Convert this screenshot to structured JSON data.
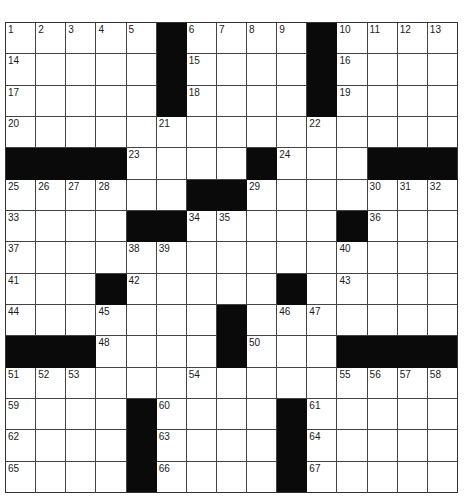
{
  "puzzle": {
    "rows": 15,
    "cols": 15,
    "colors": {
      "block": "#0a0a0a",
      "cell": "#ffffff",
      "line": "#444444"
    },
    "layout": [
      "....._...._....",
      "....._...._....",
      "....._...._....",
      "...............",
      "____...._...___",
      "......__.......",
      "....__....._...",
      "...............",
      "..._....._.....",
      "......._.......",
      "___...._...____",
      "...............",
      "...._...._.....",
      "...._...._.....",
      "...._...._....."
    ],
    "numbers": [
      {
        "r": 0,
        "c": 0,
        "n": "1"
      },
      {
        "r": 0,
        "c": 1,
        "n": "2"
      },
      {
        "r": 0,
        "c": 2,
        "n": "3"
      },
      {
        "r": 0,
        "c": 3,
        "n": "4"
      },
      {
        "r": 0,
        "c": 4,
        "n": "5"
      },
      {
        "r": 0,
        "c": 6,
        "n": "6"
      },
      {
        "r": 0,
        "c": 7,
        "n": "7"
      },
      {
        "r": 0,
        "c": 8,
        "n": "8"
      },
      {
        "r": 0,
        "c": 9,
        "n": "9"
      },
      {
        "r": 0,
        "c": 11,
        "n": "10"
      },
      {
        "r": 0,
        "c": 12,
        "n": "11"
      },
      {
        "r": 0,
        "c": 13,
        "n": "12"
      },
      {
        "r": 0,
        "c": 14,
        "n": "13"
      },
      {
        "r": 1,
        "c": 0,
        "n": "14"
      },
      {
        "r": 1,
        "c": 6,
        "n": "15"
      },
      {
        "r": 1,
        "c": 11,
        "n": "16"
      },
      {
        "r": 2,
        "c": 0,
        "n": "17"
      },
      {
        "r": 2,
        "c": 6,
        "n": "18"
      },
      {
        "r": 2,
        "c": 11,
        "n": "19"
      },
      {
        "r": 3,
        "c": 0,
        "n": "20"
      },
      {
        "r": 3,
        "c": 5,
        "n": "21"
      },
      {
        "r": 3,
        "c": 10,
        "n": "22"
      },
      {
        "r": 4,
        "c": 4,
        "n": "23"
      },
      {
        "r": 4,
        "c": 9,
        "n": "24"
      },
      {
        "r": 5,
        "c": 0,
        "n": "25"
      },
      {
        "r": 5,
        "c": 1,
        "n": "26"
      },
      {
        "r": 5,
        "c": 2,
        "n": "27"
      },
      {
        "r": 5,
        "c": 3,
        "n": "28"
      },
      {
        "r": 5,
        "c": 8,
        "n": "29"
      },
      {
        "r": 5,
        "c": 12,
        "n": "30"
      },
      {
        "r": 5,
        "c": 13,
        "n": "31"
      },
      {
        "r": 5,
        "c": 14,
        "n": "32"
      },
      {
        "r": 6,
        "c": 0,
        "n": "33"
      },
      {
        "r": 6,
        "c": 6,
        "n": "34"
      },
      {
        "r": 6,
        "c": 7,
        "n": "35"
      },
      {
        "r": 6,
        "c": 12,
        "n": "36"
      },
      {
        "r": 7,
        "c": 0,
        "n": "37"
      },
      {
        "r": 7,
        "c": 4,
        "n": "38"
      },
      {
        "r": 7,
        "c": 5,
        "n": "39"
      },
      {
        "r": 7,
        "c": 11,
        "n": "40"
      },
      {
        "r": 8,
        "c": 0,
        "n": "41"
      },
      {
        "r": 8,
        "c": 4,
        "n": "42"
      },
      {
        "r": 8,
        "c": 11,
        "n": "43"
      },
      {
        "r": 9,
        "c": 0,
        "n": "44"
      },
      {
        "r": 9,
        "c": 3,
        "n": "45"
      },
      {
        "r": 9,
        "c": 9,
        "n": "46"
      },
      {
        "r": 9,
        "c": 10,
        "n": "47"
      },
      {
        "r": 10,
        "c": 3,
        "n": "48"
      },
      {
        "r": 10,
        "c": 7,
        "n": "49"
      },
      {
        "r": 10,
        "c": 8,
        "n": "50"
      },
      {
        "r": 11,
        "c": 0,
        "n": "51"
      },
      {
        "r": 11,
        "c": 1,
        "n": "52"
      },
      {
        "r": 11,
        "c": 2,
        "n": "53"
      },
      {
        "r": 11,
        "c": 6,
        "n": "54"
      },
      {
        "r": 11,
        "c": 11,
        "n": "55"
      },
      {
        "r": 11,
        "c": 12,
        "n": "56"
      },
      {
        "r": 11,
        "c": 13,
        "n": "57"
      },
      {
        "r": 11,
        "c": 14,
        "n": "58"
      },
      {
        "r": 12,
        "c": 0,
        "n": "59"
      },
      {
        "r": 12,
        "c": 5,
        "n": "60"
      },
      {
        "r": 12,
        "c": 10,
        "n": "61"
      },
      {
        "r": 13,
        "c": 0,
        "n": "62"
      },
      {
        "r": 13,
        "c": 5,
        "n": "63"
      },
      {
        "r": 13,
        "c": 10,
        "n": "64"
      },
      {
        "r": 14,
        "c": 0,
        "n": "65"
      },
      {
        "r": 14,
        "c": 5,
        "n": "66"
      },
      {
        "r": 14,
        "c": 10,
        "n": "67"
      }
    ],
    "letters": []
  }
}
